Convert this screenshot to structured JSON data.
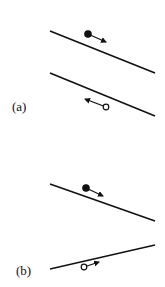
{
  "panels": [
    {
      "label": "(a)",
      "description": "Two parallel lines sloping down-right; filled particle moving along the top line, open particle moving the opposite direction along the bottom line",
      "lines": [
        {
          "x1": 50,
          "y1": 31,
          "x2": 155,
          "y2": 73
        },
        {
          "x1": 50,
          "y1": 73,
          "x2": 155,
          "y2": 116
        }
      ],
      "particles": [
        {
          "type": "filled",
          "cx": 88,
          "cy": 34,
          "arrow_to": [
            106,
            42
          ]
        },
        {
          "type": "open",
          "cx": 106,
          "cy": 107,
          "arrow_to": [
            85,
            99
          ]
        }
      ]
    },
    {
      "label": "(b)",
      "description": "Two non-parallel lines converging toward the right; filled particle on the upper line and open particle on the lower line, both moving right",
      "lines": [
        {
          "x1": 50,
          "y1": 184,
          "x2": 155,
          "y2": 221
        },
        {
          "x1": 50,
          "y1": 269,
          "x2": 155,
          "y2": 245
        }
      ],
      "particles": [
        {
          "type": "filled",
          "cx": 86,
          "cy": 188,
          "arrow_to": [
            103,
            196
          ]
        },
        {
          "type": "open",
          "cx": 84,
          "cy": 267,
          "arrow_to": [
            99,
            262
          ]
        }
      ]
    }
  ],
  "colors": {
    "ink": "#111111",
    "background": "#ffffff"
  }
}
